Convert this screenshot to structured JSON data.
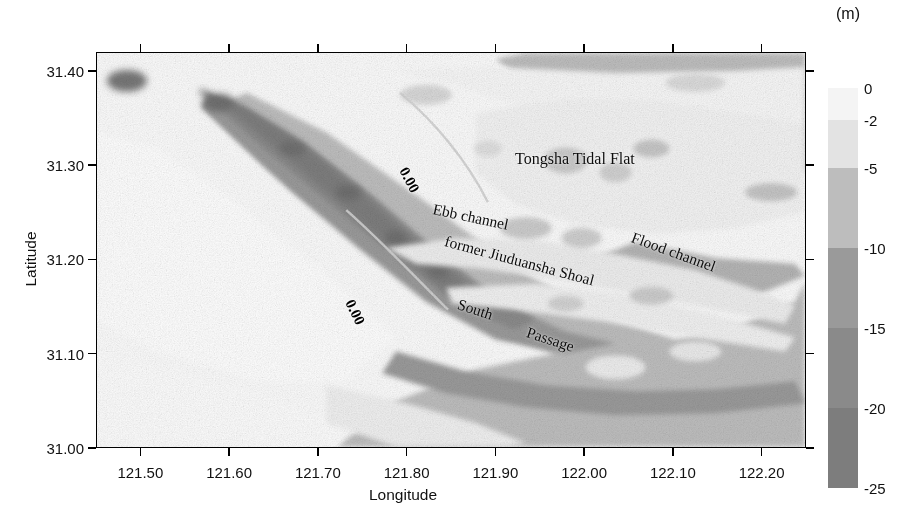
{
  "figure": {
    "type": "bathymetry-map",
    "unit_label": "(m)"
  },
  "axes": {
    "x": {
      "title": "Longitude",
      "min": 121.45,
      "max": 122.25,
      "ticks": [
        "121.50",
        "121.60",
        "121.70",
        "121.80",
        "121.90",
        "122.00",
        "122.10",
        "122.20"
      ],
      "tick_values": [
        121.5,
        121.6,
        121.7,
        121.8,
        121.9,
        122.0,
        122.1,
        122.2
      ]
    },
    "y": {
      "title": "Latitude",
      "min": 31.0,
      "max": 31.42,
      "ticks": [
        "31.00",
        "31.10",
        "31.20",
        "31.30",
        "31.40"
      ],
      "tick_values": [
        31.0,
        31.1,
        31.2,
        31.3,
        31.4
      ]
    }
  },
  "colorbar": {
    "unit": "(m)",
    "orientation": "vertical",
    "tick_labels": [
      "0",
      "-2",
      "-5",
      "-10",
      "-15",
      "-20",
      "-25"
    ],
    "tick_values": [
      0,
      -2,
      -5,
      -10,
      -15,
      -20,
      -25
    ],
    "bands": [
      {
        "from": 0,
        "to": -2,
        "color": "#f4f4f4"
      },
      {
        "from": -2,
        "to": -5,
        "color": "#e3e3e3"
      },
      {
        "from": -5,
        "to": -10,
        "color": "#bdbdbd"
      },
      {
        "from": -10,
        "to": -15,
        "color": "#9a9a9a"
      },
      {
        "from": -15,
        "to": -20,
        "color": "#8a8a8a"
      },
      {
        "from": -20,
        "to": -25,
        "color": "#7d7d7d"
      }
    ]
  },
  "map_labels": [
    {
      "text": "Tongsha Tidal Flat",
      "x": 515,
      "y": 150,
      "rotation": 0,
      "size": 16
    },
    {
      "text": "Ebb   channel",
      "x": 433,
      "y": 200,
      "rotation": 12,
      "size": 15.5
    },
    {
      "text": "Flood channel",
      "x": 632,
      "y": 228,
      "rotation": 20,
      "size": 15.5
    },
    {
      "text": "former Jiuduansha Shoal",
      "x": 445,
      "y": 232,
      "rotation": 15,
      "size": 15.5
    },
    {
      "text": "South",
      "x": 458,
      "y": 295,
      "rotation": 18,
      "size": 15.5
    },
    {
      "text": "Passage",
      "x": 527,
      "y": 323,
      "rotation": 18,
      "size": 15.5
    }
  ],
  "contour_labels": [
    {
      "text": "0.00",
      "x": 403,
      "y": 160,
      "rotation": 62
    },
    {
      "text": "0.00",
      "x": 349,
      "y": 292,
      "rotation": 64
    }
  ],
  "chart_data": {
    "type": "heatmap",
    "title": "",
    "xlabel": "Longitude",
    "ylabel": "Latitude",
    "zlabel": "(m)",
    "xlim": [
      121.45,
      122.25
    ],
    "ylim": [
      31.0,
      31.42
    ],
    "zlim": [
      -25,
      0
    ],
    "grid": false,
    "legend_position": "right",
    "colorbar_levels": [
      0,
      -2,
      -5,
      -10,
      -15,
      -20,
      -25
    ],
    "colorbar_colors": [
      "#f4f4f4",
      "#e3e3e3",
      "#bdbdbd",
      "#9a9a9a",
      "#8a8a8a",
      "#7d7d7d"
    ],
    "contour_levels": [
      0.0
    ],
    "annotations": [
      "Tongsha Tidal Flat",
      "Ebb   channel",
      "Flood channel",
      "former Jiuduansha Shoal",
      "South",
      "Passage"
    ]
  }
}
